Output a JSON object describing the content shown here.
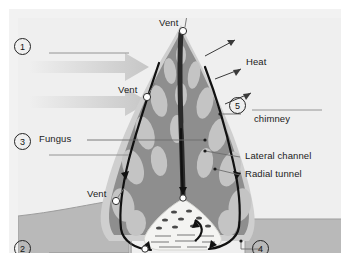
{
  "diagram": {
    "panel": {
      "background": "#f2f2f2"
    },
    "colors": {
      "sky": "#efefef",
      "ground": "#b9b9b9",
      "ground_edge": "#9d9d9d",
      "mound_outer": "#cfcfcf",
      "mound_body": "#8e8e8e",
      "tunnel_fill": "#c4c4c4",
      "nest_fill": "#f4f4f2",
      "nest_edge": "#d6d6d2",
      "airflow": "#111111",
      "wind_arrow": "#cfcfcf",
      "text": "#1b1b1b",
      "leader": "#6d6d6d",
      "blank_line": "#8a8a8a",
      "vent_dot": "#ffffff"
    },
    "numbers": [
      {
        "id": "1",
        "label": "1"
      },
      {
        "id": "2",
        "label": "2"
      },
      {
        "id": "3",
        "label": "3"
      },
      {
        "id": "4",
        "label": "4"
      },
      {
        "id": "5",
        "label": "5"
      }
    ],
    "labels": {
      "vent_top": "Vent",
      "vent_mid": "Vent",
      "vent_low": "Vent",
      "heat": "Heat",
      "fungus": "Fungus",
      "chimney": "chimney",
      "lateral_channel": "Lateral channel",
      "radial_tunnel": "Radial tunnel"
    },
    "blank_answer_lines": [
      {
        "for": "1"
      },
      {
        "for": "2"
      },
      {
        "for": "3"
      },
      {
        "for": "4"
      },
      {
        "for": "5"
      }
    ],
    "icon_names": {
      "wind": "wind-arrow-icon",
      "heat": "heat-arrow-icon",
      "airflow": "airflow-arrow-icon",
      "vent": "vent-marker-icon"
    }
  }
}
